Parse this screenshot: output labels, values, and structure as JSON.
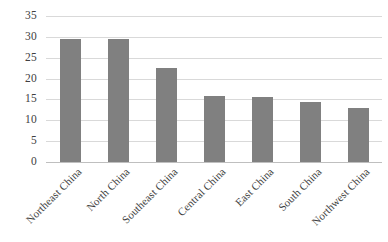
{
  "chart_data": {
    "type": "bar",
    "title": "",
    "subtitle": "",
    "xlabel": "",
    "ylabel": "",
    "categories": [
      "Northeast China",
      "North China",
      "Southeast China",
      "Central China",
      "East China",
      "South China",
      "Northwest China"
    ],
    "values": [
      29.5,
      29.5,
      22.5,
      15.8,
      15.5,
      14.5,
      13.0
    ],
    "series": [
      {
        "name": "Share",
        "values": [
          29.5,
          29.5,
          22.5,
          15.8,
          15.5,
          14.5,
          13.0
        ]
      }
    ],
    "ylim": [
      0,
      35
    ],
    "ytick_values": [
      0,
      5,
      10,
      15,
      20,
      25,
      30,
      35
    ],
    "ytick_labels": [
      "0",
      "5",
      "10",
      "15",
      "20",
      "25",
      "30",
      "35"
    ],
    "grid": "horizontal",
    "legend": "none",
    "bar_color": "#808080",
    "gridline_color": "#d9d9d9",
    "axis_color": "#bfbfbf",
    "xtick_rotation": -45
  },
  "caption": {
    "text": ""
  }
}
